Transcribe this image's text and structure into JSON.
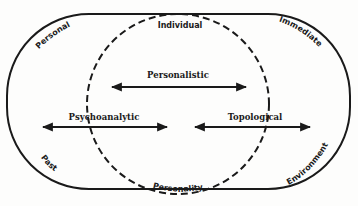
{
  "diagram": {
    "outer_shape": "stadium",
    "inner_shape": "dashed-circle",
    "colors": {
      "ink": "#1a1a1a",
      "background": "#fdfdfc"
    },
    "corner_labels": {
      "top_left": "Personal",
      "top_right": "Immediate",
      "bottom_left": "Past",
      "bottom_right": "Environment"
    },
    "circle_labels": {
      "top": "Individual",
      "bottom": "Personality"
    },
    "arrows": [
      {
        "label": "Personalistic",
        "direction": "bidirectional"
      },
      {
        "label": "Psychoanalytic",
        "direction": "bidirectional"
      },
      {
        "label": "Topological",
        "direction": "bidirectional"
      }
    ]
  }
}
